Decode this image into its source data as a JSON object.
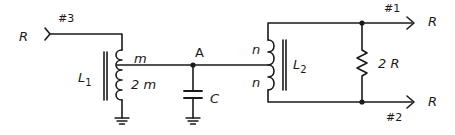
{
  "diagram": {
    "type": "circuit-schematic",
    "input": {
      "port_label": "#3",
      "source_label": "R"
    },
    "inductor1": {
      "name": "L",
      "subscript": "1",
      "upper_turns": "m",
      "lower_turns": "2 m"
    },
    "node": {
      "label": "A"
    },
    "capacitor": {
      "label": "C"
    },
    "inductor2": {
      "name": "L",
      "subscript": "2",
      "upper_turns": "n",
      "lower_turns": "n"
    },
    "resistor": {
      "label": "2 R"
    },
    "outputs": [
      {
        "port_label": "#1",
        "load_label": "R"
      },
      {
        "port_label": "#2",
        "load_label": "R"
      }
    ],
    "colors": {
      "line": "#1a1a1a",
      "background": "#ffffff"
    }
  }
}
